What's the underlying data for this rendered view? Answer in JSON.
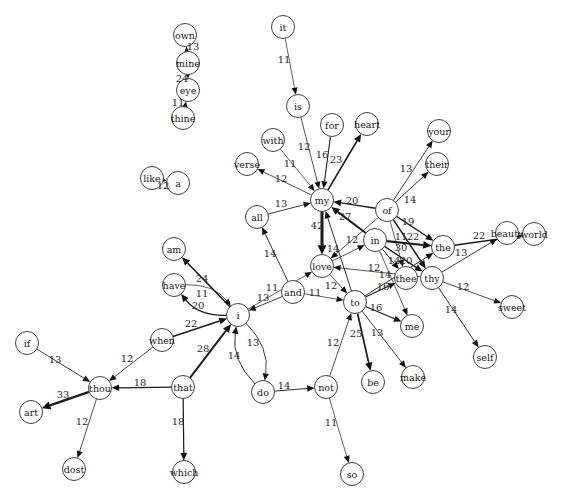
{
  "graph": {
    "type": "directed-word-bigram-network",
    "node_radius": 11.5,
    "nodes": [
      {
        "id": "own",
        "label": "own",
        "x": 185,
        "y": 35
      },
      {
        "id": "mine",
        "label": "mine",
        "x": 188,
        "y": 63
      },
      {
        "id": "eye",
        "label": "eye",
        "x": 188,
        "y": 90
      },
      {
        "id": "thine",
        "label": "thine",
        "x": 183,
        "y": 118
      },
      {
        "id": "it",
        "label": "it",
        "x": 283,
        "y": 27
      },
      {
        "id": "is",
        "label": "is",
        "x": 298,
        "y": 106
      },
      {
        "id": "for",
        "label": "for",
        "x": 332,
        "y": 125
      },
      {
        "id": "heart",
        "label": "heart",
        "x": 367,
        "y": 124
      },
      {
        "id": "with",
        "label": "with",
        "x": 273,
        "y": 140
      },
      {
        "id": "verse",
        "label": "verse",
        "x": 247,
        "y": 164
      },
      {
        "id": "like",
        "label": "like",
        "x": 152,
        "y": 178
      },
      {
        "id": "a",
        "label": "a",
        "x": 178,
        "y": 183
      },
      {
        "id": "my",
        "label": "my",
        "x": 322,
        "y": 200
      },
      {
        "id": "your",
        "label": "your",
        "x": 439,
        "y": 131
      },
      {
        "id": "their",
        "label": "their",
        "x": 437,
        "y": 164
      },
      {
        "id": "of",
        "label": "of",
        "x": 387,
        "y": 210
      },
      {
        "id": "all",
        "label": "all",
        "x": 257,
        "y": 217
      },
      {
        "id": "in",
        "label": "in",
        "x": 375,
        "y": 240
      },
      {
        "id": "the",
        "label": "the",
        "x": 443,
        "y": 247
      },
      {
        "id": "beauty",
        "label": "beauty",
        "x": 507,
        "y": 233
      },
      {
        "id": "world",
        "label": "world",
        "x": 534,
        "y": 234
      },
      {
        "id": "love",
        "label": "love",
        "x": 322,
        "y": 266
      },
      {
        "id": "thee",
        "label": "thee",
        "x": 406,
        "y": 278
      },
      {
        "id": "thy",
        "label": "thy",
        "x": 432,
        "y": 278
      },
      {
        "id": "am",
        "label": "am",
        "x": 174,
        "y": 249
      },
      {
        "id": "have",
        "label": "have",
        "x": 174,
        "y": 285
      },
      {
        "id": "and",
        "label": "and",
        "x": 293,
        "y": 292
      },
      {
        "id": "i",
        "label": "i",
        "x": 238,
        "y": 315
      },
      {
        "id": "to",
        "label": "to",
        "x": 355,
        "y": 302
      },
      {
        "id": "sweet",
        "label": "sweet",
        "x": 512,
        "y": 307
      },
      {
        "id": "me",
        "label": "me",
        "x": 412,
        "y": 326
      },
      {
        "id": "when",
        "label": "when",
        "x": 162,
        "y": 340
      },
      {
        "id": "if",
        "label": "if",
        "x": 27,
        "y": 343
      },
      {
        "id": "self",
        "label": "self",
        "x": 485,
        "y": 357
      },
      {
        "id": "thou",
        "label": "thou",
        "x": 100,
        "y": 388
      },
      {
        "id": "that",
        "label": "that",
        "x": 183,
        "y": 387
      },
      {
        "id": "do",
        "label": "do",
        "x": 263,
        "y": 392
      },
      {
        "id": "not",
        "label": "not",
        "x": 326,
        "y": 387
      },
      {
        "id": "be",
        "label": "be",
        "x": 373,
        "y": 382
      },
      {
        "id": "make",
        "label": "make",
        "x": 413,
        "y": 377
      },
      {
        "id": "art",
        "label": "art",
        "x": 31,
        "y": 412
      },
      {
        "id": "dost",
        "label": "dost",
        "x": 74,
        "y": 469
      },
      {
        "id": "which",
        "label": "which",
        "x": 184,
        "y": 472
      },
      {
        "id": "so",
        "label": "so",
        "x": 352,
        "y": 474
      }
    ],
    "edges": [
      {
        "source": "mine",
        "target": "own",
        "weight": 13,
        "label": "13",
        "lx": 193,
        "ly": 46
      },
      {
        "source": "mine",
        "target": "eye",
        "weight": 24,
        "label": "24",
        "lx": 182,
        "ly": 78
      },
      {
        "source": "thine",
        "target": "eye",
        "weight": 11,
        "label": "11",
        "lx": 178,
        "ly": 102
      },
      {
        "source": "it",
        "target": "is",
        "weight": 11,
        "label": "11",
        "lx": 284,
        "ly": 59
      },
      {
        "source": "is",
        "target": "my",
        "weight": 12,
        "label": "12",
        "lx": 304,
        "ly": 146
      },
      {
        "source": "for",
        "target": "my",
        "weight": 16,
        "label": "16",
        "lx": 322,
        "ly": 154
      },
      {
        "source": "my",
        "target": "heart",
        "weight": 23,
        "label": "23",
        "lx": 336,
        "ly": 159
      },
      {
        "source": "with",
        "target": "my",
        "weight": 11,
        "label": "11",
        "lx": 290,
        "ly": 163
      },
      {
        "source": "my",
        "target": "verse",
        "weight": 12,
        "label": "12",
        "lx": 281,
        "ly": 178
      },
      {
        "source": "like",
        "target": "a",
        "weight": 12,
        "label": "12",
        "lx": 163,
        "ly": 185
      },
      {
        "source": "all",
        "target": "my",
        "weight": 13,
        "label": "13",
        "lx": 281,
        "ly": 203
      },
      {
        "source": "of",
        "target": "my",
        "weight": 20,
        "label": "20",
        "lx": 352,
        "ly": 200
      },
      {
        "source": "in",
        "target": "my",
        "weight": 27,
        "label": "27",
        "lx": 345,
        "ly": 216
      },
      {
        "source": "my",
        "target": "love",
        "weight": 42,
        "label": "42",
        "lx": 317,
        "ly": 225
      },
      {
        "source": "of",
        "target": "your",
        "weight": 13,
        "label": "13",
        "lx": 406,
        "ly": 168
      },
      {
        "source": "of",
        "target": "their",
        "weight": 14,
        "label": "14",
        "lx": 410,
        "ly": 199
      },
      {
        "source": "of",
        "target": "the",
        "weight": 19,
        "label": "19",
        "lx": 408,
        "ly": 221
      },
      {
        "source": "of",
        "target": "thee",
        "weight": 11,
        "label": "11",
        "lx": 401,
        "ly": 236
      },
      {
        "source": "of",
        "target": "thy",
        "weight": 22,
        "label": "22",
        "lx": 413,
        "ly": 236
      },
      {
        "source": "in",
        "target": "the",
        "weight": 30,
        "label": "30",
        "lx": 401,
        "ly": 247
      },
      {
        "source": "in",
        "target": "thee",
        "weight": 14,
        "label": "14",
        "lx": 394,
        "ly": 260
      },
      {
        "source": "in",
        "target": "thy",
        "weight": 20,
        "label": "20",
        "lx": 406,
        "ly": 260
      },
      {
        "source": "in",
        "target": "me",
        "weight": null,
        "label": ""
      },
      {
        "source": "the",
        "target": "world",
        "weight": 22,
        "label": "22",
        "lx": 479,
        "ly": 235
      },
      {
        "source": "thy",
        "target": "beauty",
        "weight": 13,
        "label": "13",
        "lx": 461,
        "ly": 252
      },
      {
        "source": "thy",
        "target": "sweet",
        "weight": 12,
        "label": "12",
        "lx": 463,
        "ly": 286
      },
      {
        "source": "thy",
        "target": "self",
        "weight": 14,
        "label": "14",
        "lx": 451,
        "ly": 309
      },
      {
        "source": "thy",
        "target": "love",
        "weight": 12,
        "label": "12",
        "lx": 374,
        "ly": 267
      },
      {
        "source": "to",
        "target": "the",
        "weight": 14,
        "label": "14",
        "lx": 385,
        "ly": 274
      },
      {
        "source": "to",
        "target": "thee",
        "weight": 16,
        "label": "16",
        "lx": 383,
        "ly": 286
      },
      {
        "source": "to",
        "target": "me",
        "weight": 16,
        "label": "16",
        "lx": 376,
        "ly": 307
      },
      {
        "source": "to",
        "target": "be",
        "weight": 25,
        "label": "25",
        "lx": 356,
        "ly": 333
      },
      {
        "source": "to",
        "target": "make",
        "weight": 13,
        "label": "13",
        "lx": 377,
        "ly": 332
      },
      {
        "source": "to",
        "target": "my",
        "weight": 14,
        "label": "14",
        "lx": 333,
        "ly": 248
      },
      {
        "source": "of",
        "target": "love",
        "weight": 12,
        "label": "12",
        "lx": 352,
        "ly": 239
      },
      {
        "source": "love",
        "target": "to",
        "weight": 12,
        "label": "12",
        "lx": 331,
        "ly": 285
      },
      {
        "source": "love",
        "target": "in",
        "weight": null,
        "label": ""
      },
      {
        "source": "i",
        "target": "love",
        "weight": 11,
        "label": "11",
        "lx": 272,
        "ly": 287
      },
      {
        "source": "and",
        "target": "i",
        "weight": 13,
        "label": "13",
        "lx": 263,
        "ly": 297
      },
      {
        "source": "and",
        "target": "to",
        "weight": 11,
        "label": "11",
        "lx": 315,
        "ly": 292
      },
      {
        "source": "and",
        "target": "all",
        "weight": 14,
        "label": "14",
        "lx": 270,
        "ly": 253
      },
      {
        "source": "i",
        "target": "am",
        "weight": 24,
        "label": "24",
        "lx": 202,
        "ly": 278
      },
      {
        "source": "have",
        "target": "i",
        "weight": 11,
        "label": "11",
        "lx": 202,
        "ly": 293,
        "bend": 0.25
      },
      {
        "source": "i",
        "target": "have",
        "weight": 20,
        "label": "20",
        "lx": 198,
        "ly": 305,
        "bend": 0.25
      },
      {
        "source": "when",
        "target": "i",
        "weight": 22,
        "label": "22",
        "lx": 191,
        "ly": 323
      },
      {
        "source": "that",
        "target": "i",
        "weight": 28,
        "label": "28",
        "lx": 203,
        "ly": 348
      },
      {
        "source": "i",
        "target": "do",
        "weight": 13,
        "label": "13",
        "lx": 253,
        "ly": 342,
        "bend": 0.25
      },
      {
        "source": "do",
        "target": "i",
        "weight": 14,
        "label": "14",
        "lx": 234,
        "ly": 355,
        "bend": 0.25
      },
      {
        "source": "do",
        "target": "not",
        "weight": 14,
        "label": "14",
        "lx": 284,
        "ly": 385
      },
      {
        "source": "not",
        "target": "to",
        "weight": 12,
        "label": "12",
        "lx": 333,
        "ly": 342
      },
      {
        "source": "not",
        "target": "so",
        "weight": 11,
        "label": "11",
        "lx": 331,
        "ly": 422
      },
      {
        "source": "if",
        "target": "thou",
        "weight": 13,
        "label": "13",
        "lx": 55,
        "ly": 359
      },
      {
        "source": "when",
        "target": "thou",
        "weight": 12,
        "label": "12",
        "lx": 127,
        "ly": 358
      },
      {
        "source": "that",
        "target": "thou",
        "weight": 18,
        "label": "18",
        "lx": 140,
        "ly": 382
      },
      {
        "source": "thou",
        "target": "art",
        "weight": 33,
        "label": "33",
        "lx": 63,
        "ly": 394
      },
      {
        "source": "thou",
        "target": "dost",
        "weight": 12,
        "label": "12",
        "lx": 82,
        "ly": 421
      },
      {
        "source": "that",
        "target": "which",
        "weight": 18,
        "label": "18",
        "lx": 178,
        "ly": 421
      }
    ]
  }
}
